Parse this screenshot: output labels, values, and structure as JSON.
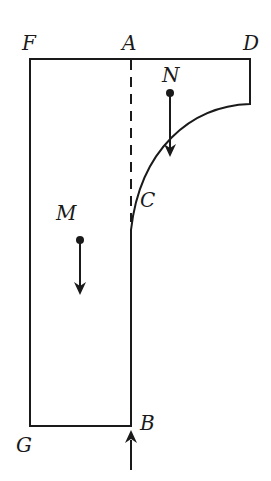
{
  "diagram": {
    "labels": {
      "F": "F",
      "A": "A",
      "D": "D",
      "N": "N",
      "M": "M",
      "C": "C",
      "G": "G",
      "B": "B"
    },
    "colors": {
      "stroke": "#1a1a1a",
      "background": "#ffffff"
    },
    "elements": {
      "outline": "solid outline F-D-curve-C-B-G-F",
      "dashed_line": "vertical dashed line A to C",
      "force_N": "downward arrow from point N",
      "force_M": "downward arrow from point M",
      "force_B": "upward arrow at B"
    }
  }
}
